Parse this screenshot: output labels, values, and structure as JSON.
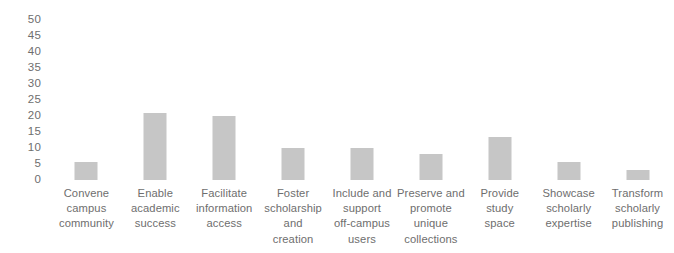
{
  "chart_data": {
    "type": "bar",
    "title": "",
    "subtitle": "",
    "xlabel": "",
    "ylabel": "",
    "ylim": [
      0,
      50
    ],
    "grid": false,
    "legend": false,
    "legend_position": "none",
    "bar_color": "#c6c6c6",
    "background_color": "#ffffff",
    "text_color": "#6e6e6e",
    "y_ticks": [
      "50",
      "45",
      "40",
      "35",
      "30",
      "25",
      "20",
      "15",
      "10",
      "5",
      "0"
    ],
    "categories": [
      "Convene campus community",
      "Enable academic success",
      "Facilitate information access",
      "Foster scholarship and creation",
      "Include and support off-campus users",
      "Preserve and promote unique collections",
      "Provide study space",
      "Showcase scholarly expertise",
      "Transform scholarly publishing"
    ],
    "category_lines": [
      [
        "Convene",
        "campus",
        "community"
      ],
      [
        "Enable",
        "academic",
        "success"
      ],
      [
        "Facilitate",
        "information",
        "access"
      ],
      [
        "Foster",
        "scholarship",
        "and",
        "creation"
      ],
      [
        "Include and",
        "support",
        "off-campus",
        "users"
      ],
      [
        "Preserve and",
        "promote",
        "unique",
        "collections"
      ],
      [
        "Provide",
        "study",
        "space"
      ],
      [
        "Showcase",
        "scholarly",
        "expertise"
      ],
      [
        "Transform",
        "scholarly",
        "publishing"
      ]
    ],
    "values": [
      5.5,
      21,
      20,
      10,
      10,
      8,
      13.5,
      5.5,
      3
    ]
  }
}
